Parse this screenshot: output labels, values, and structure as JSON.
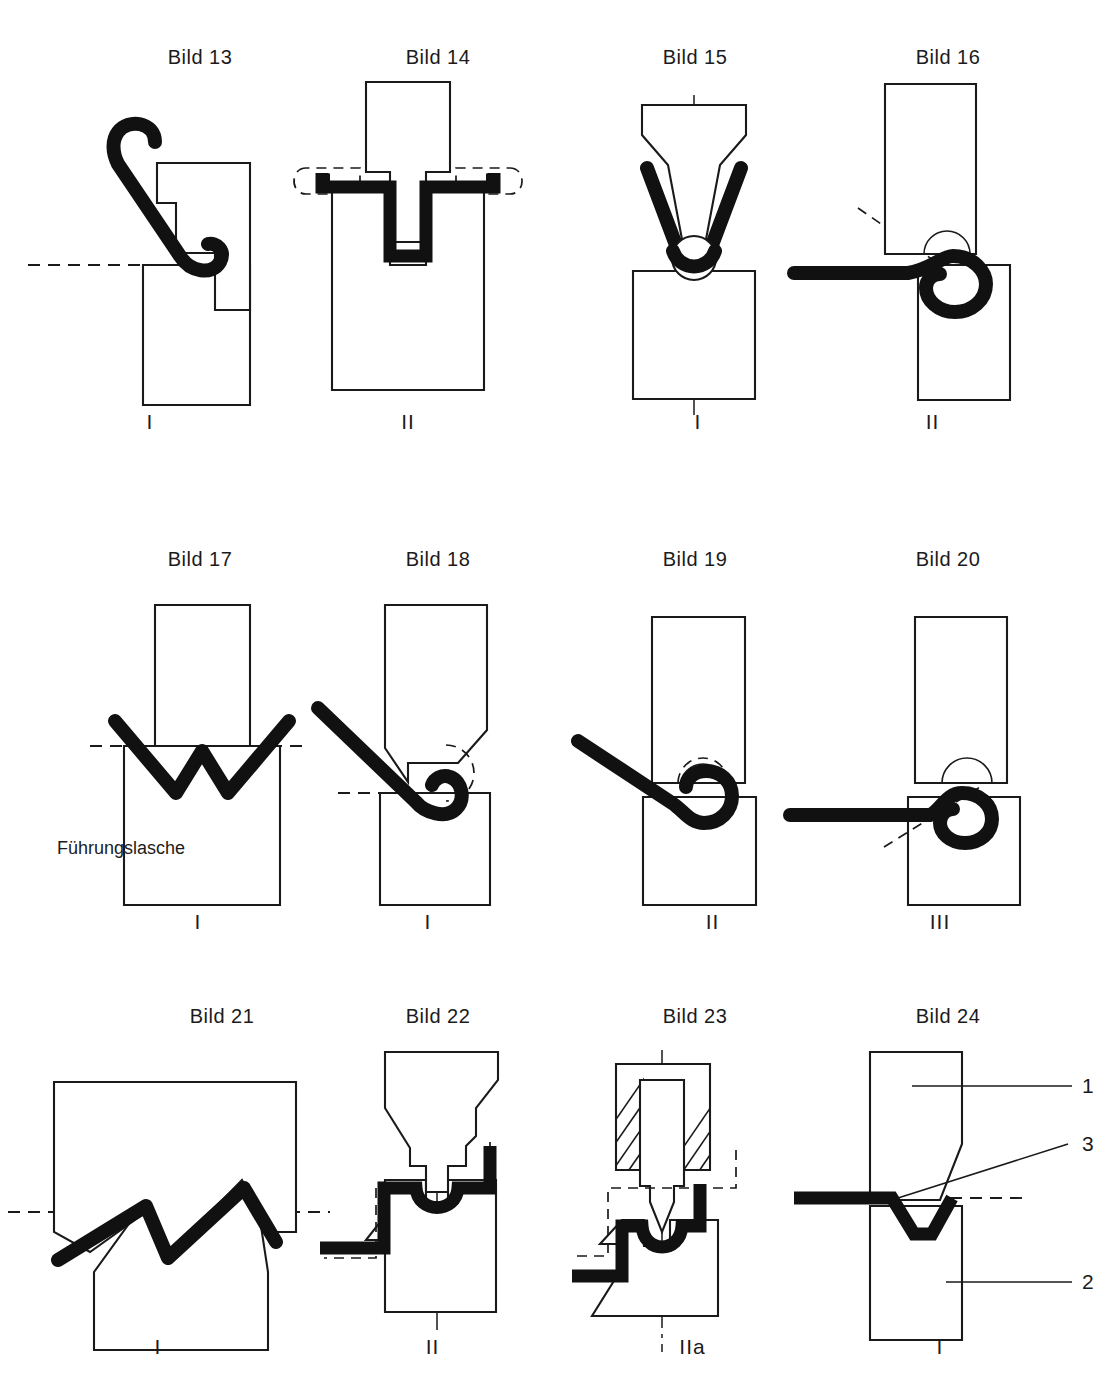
{
  "page": {
    "kind": "technical-drawing-plate",
    "language": "de",
    "cut_off_top_line": "",
    "background_color": "#ffffff",
    "line_color": "#1a1a1a",
    "blank_color": "#111111"
  },
  "figures": [
    {
      "id": "bild-13",
      "caption": "Bild 13",
      "roman": "I",
      "row": 1,
      "col": 1,
      "features": [
        "hooked-sheet-blank",
        "upper-die-chamfered",
        "lower-die-rect",
        "dashed-reference-line"
      ]
    },
    {
      "id": "bild-14",
      "caption": "Bild 14",
      "roman": "II",
      "row": 1,
      "col": 2,
      "features": [
        "channel-formed-blank",
        "upper-punch-rect-with-tongue",
        "lower-die-rect",
        "dashed-outline-ends"
      ]
    },
    {
      "id": "bild-15",
      "caption": "Bild 15",
      "roman": "I",
      "row": 1,
      "col": 3,
      "features": [
        "v-bent-blank",
        "wedge-punch",
        "lower-die-rect",
        "center-line"
      ]
    },
    {
      "id": "bild-16",
      "caption": "Bild 16",
      "roman": "II",
      "row": 1,
      "col": 4,
      "features": [
        "curled-blank-loop",
        "upper-die-rect",
        "lower-die-rect",
        "dashed-angle-line"
      ]
    },
    {
      "id": "bild-17",
      "caption": "Bild 17",
      "roman": "I",
      "row": 2,
      "col": 1,
      "inner_label": "Führungslasche",
      "features": [
        "w-bent-blank",
        "upper-punch-rect",
        "lower-die-rect",
        "dashed-reference-line"
      ]
    },
    {
      "id": "bild-18",
      "caption": "Bild 18",
      "roman": "I",
      "row": 2,
      "col": 2,
      "features": [
        "curling-blank",
        "chamfered-punch",
        "lower-die-rect",
        "dashed-arc",
        "dashed-reference-line"
      ]
    },
    {
      "id": "bild-19",
      "caption": "Bild 19",
      "roman": "II",
      "row": 2,
      "col": 3,
      "features": [
        "curled-blank-loop",
        "upper-die-rect",
        "lower-die-rect",
        "dashed-arc"
      ]
    },
    {
      "id": "bild-20",
      "caption": "Bild 20",
      "roman": "III",
      "row": 2,
      "col": 4,
      "features": [
        "closed-curl-blank",
        "upper-die-rect",
        "lower-die-rect",
        "dashed-angle-line"
      ]
    },
    {
      "id": "bild-21",
      "caption": "Bild 21",
      "roman": "I",
      "row": 3,
      "col": 1,
      "features": [
        "zigzag-blank",
        "wide-upper-die-zigzag",
        "lower-die-zigzag",
        "dashed-reference-line"
      ]
    },
    {
      "id": "bild-22",
      "caption": "Bild 22",
      "roman": "II",
      "row": 3,
      "col": 2,
      "features": [
        "beaded-blank",
        "shaped-punch",
        "shaped-die",
        "center-line",
        "dashed-outline"
      ]
    },
    {
      "id": "bild-23",
      "caption": "Bild 23",
      "roman": "IIa",
      "row": 3,
      "col": 3,
      "features": [
        "beaded-blank",
        "hatched-holder",
        "plunger",
        "shaped-die",
        "center-line",
        "dashed-outline"
      ]
    },
    {
      "id": "bild-24",
      "caption": "Bild 24",
      "roman": "I",
      "row": 3,
      "col": 4,
      "features": [
        "v-beaded-blank",
        "chamfered-punch",
        "lower-die-rect",
        "leader-lines",
        "dashed-reference-line"
      ],
      "callouts": [
        {
          "id": "callout-1",
          "text": "1",
          "target": "upper-tool"
        },
        {
          "id": "callout-3",
          "text": "3",
          "target": "blank"
        },
        {
          "id": "callout-2",
          "text": "2",
          "target": "lower-tool"
        }
      ]
    }
  ]
}
